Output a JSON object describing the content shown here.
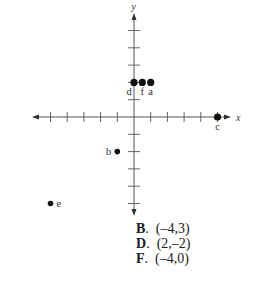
{
  "diagram": {
    "type": "coordinate-plane",
    "axes": {
      "x_label": "x",
      "y_label": "y",
      "x_range": [
        -6,
        6
      ],
      "y_range": [
        -6,
        6
      ],
      "tick_interval": 1
    },
    "points": [
      {
        "label": "a",
        "x": 1,
        "y": 2
      },
      {
        "label": "b",
        "x": -1,
        "y": -2
      },
      {
        "label": "c",
        "x": 5,
        "y": 0
      },
      {
        "label": "d",
        "x": 0,
        "y": 2
      },
      {
        "label": "e",
        "x": -5,
        "y": -5
      },
      {
        "label": "f",
        "x": 0.5,
        "y": 2
      }
    ]
  },
  "answers": [
    {
      "letter": "B",
      "text": "(–4,3)"
    },
    {
      "letter": "D",
      "text": "(2,–2)"
    },
    {
      "letter": "F",
      "text": "(–4,0)"
    }
  ]
}
